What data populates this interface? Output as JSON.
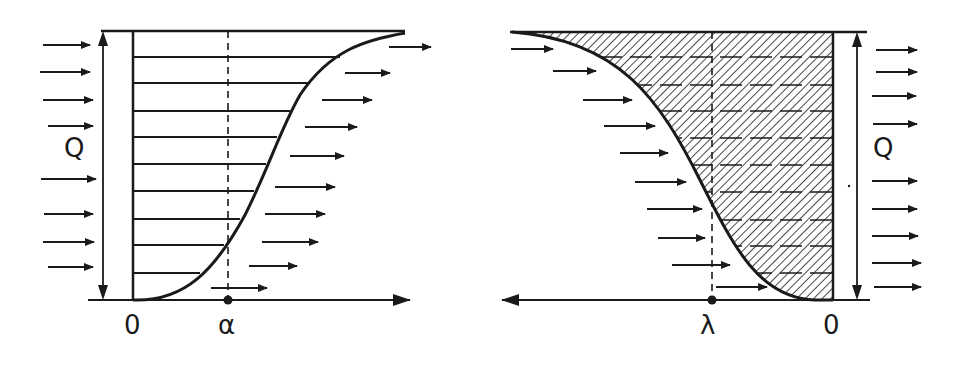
{
  "left_panel": {
    "q_label": "Q",
    "origin_label": "0",
    "marker_label": "α",
    "description": "flow profile with horizontal strata, curve rising from origin to top right"
  },
  "right_panel": {
    "q_label": "Q",
    "origin_label": "0",
    "marker_label": "λ",
    "description": "mirrored hatched flow profile, curve falling from top left to origin"
  },
  "colors": {
    "ink": "#1a1a1a",
    "background": "#ffffff"
  }
}
